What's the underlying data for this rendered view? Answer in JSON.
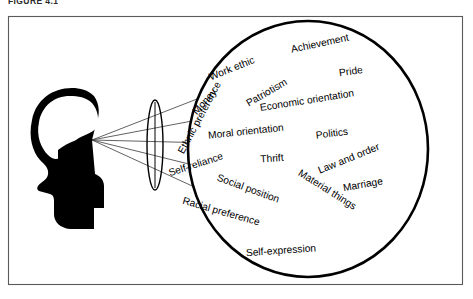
{
  "figure": {
    "caption": "FIGURE 4.1",
    "frame": {
      "x": 8,
      "y": 16,
      "width": 455,
      "height": 269,
      "border_color": "#5a5a5a"
    },
    "circle": {
      "cx": 308,
      "cy": 149,
      "rx": 120,
      "ry": 128,
      "stroke_color": "#000000",
      "fill": "#ffffff"
    },
    "head": {
      "color": "#000000",
      "eye_point_x": 92,
      "eye_point_y": 140
    },
    "lens": {
      "cx": 155,
      "cy": 145,
      "rx": 8,
      "ry": 45,
      "stroke_color": "#000000"
    },
    "rays_count": 5
  },
  "values": [
    {
      "label": "Achievement",
      "x": 320,
      "y": 44,
      "rotate": -12
    },
    {
      "label": "Work ethic",
      "x": 232,
      "y": 69,
      "rotate": -22
    },
    {
      "label": "Pride",
      "x": 351,
      "y": 72,
      "rotate": -8
    },
    {
      "label": "Money",
      "x": 205,
      "y": 102,
      "rotate": -48
    },
    {
      "label": "Patriotism",
      "x": 267,
      "y": 93,
      "rotate": -30
    },
    {
      "label": "Economic orientation",
      "x": 307,
      "y": 101,
      "rotate": -9
    },
    {
      "label": "Ethnic preference",
      "x": 200,
      "y": 118,
      "rotate": -62
    },
    {
      "label": "Moral orientation",
      "x": 246,
      "y": 132,
      "rotate": -6
    },
    {
      "label": "Politics",
      "x": 332,
      "y": 134,
      "rotate": -7
    },
    {
      "label": "Self-reliance",
      "x": 196,
      "y": 165,
      "rotate": -18
    },
    {
      "label": "Thrift",
      "x": 272,
      "y": 159,
      "rotate": -4
    },
    {
      "label": "Law and order",
      "x": 349,
      "y": 159,
      "rotate": -22
    },
    {
      "label": "Social position",
      "x": 248,
      "y": 189,
      "rotate": 20
    },
    {
      "label": "Material things",
      "x": 327,
      "y": 190,
      "rotate": 32
    },
    {
      "label": "Marriage",
      "x": 363,
      "y": 185,
      "rotate": -10
    },
    {
      "label": "Racial preference",
      "x": 221,
      "y": 212,
      "rotate": 16
    },
    {
      "label": "Self-expression",
      "x": 281,
      "y": 251,
      "rotate": -4
    }
  ]
}
